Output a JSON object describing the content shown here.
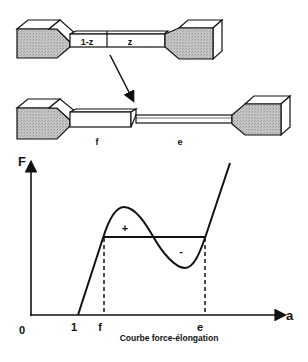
{
  "top_specimen": {
    "segment_left_label": "1-z",
    "segment_right_label": "z"
  },
  "bottom_specimen": {
    "thick_part_label": "f",
    "thin_part_label": "e"
  },
  "graph": {
    "y_axis_label": "F",
    "x_axis_label": "a",
    "origin_label": "0",
    "tick_one_label": "1",
    "tick_f_label": "f",
    "tick_e_label": "e",
    "area_plus_label": "+",
    "area_minus_label": "-",
    "caption": "Courbe force-élongation"
  },
  "colors": {
    "ink": "#111111",
    "grip_fill": "#b8b8b8",
    "face_fill": "#ffffff"
  }
}
